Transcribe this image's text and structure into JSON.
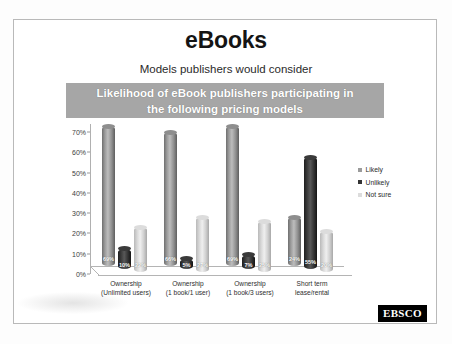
{
  "slide": {
    "title": "eBooks",
    "subtitle": "Models publishers would consider",
    "banner_line1": "Likelihood of eBook publishers participating in",
    "banner_line2": "the following pricing models",
    "banner_color": "#a6a6a6",
    "logo": "EBSCO"
  },
  "chart_data": {
    "type": "bar",
    "title": "Likelihood of eBook publishers participating in the following pricing models",
    "xlabel": "",
    "ylabel": "",
    "ylim": [
      0,
      70
    ],
    "grid": false,
    "legend_position": "right",
    "ytick_labels": [
      "0%",
      "10%",
      "20%",
      "30%",
      "40%",
      "50%",
      "60%",
      "70%"
    ],
    "ytick_values": [
      0,
      10,
      20,
      30,
      40,
      50,
      60,
      70
    ],
    "categories": [
      "Ownership (Unlimited users)",
      "Ownership (1 book/1 user)",
      "Ownership (1 book/3 users)",
      "Short term lease/rental"
    ],
    "category_lines": [
      [
        "Ownership",
        "(Unlimited users)"
      ],
      [
        "Ownership",
        "(1 book/1 user)"
      ],
      [
        "Ownership",
        "(1 book/3 users)"
      ],
      [
        "Short term",
        "lease/rental"
      ]
    ],
    "series": [
      {
        "name": "Likely",
        "color": "#9b9b9b",
        "values": [
          69,
          66,
          69,
          24
        ],
        "labels": [
          "69%",
          "66%",
          "69%",
          "24%"
        ]
      },
      {
        "name": "Unlikely",
        "color": "#333333",
        "values": [
          10,
          5,
          7,
          55
        ],
        "labels": [
          "10%",
          "5%",
          "7%",
          "55%"
        ]
      },
      {
        "name": "Not sure",
        "color": "#dcdcdc",
        "values": [
          22,
          27,
          25,
          20
        ],
        "labels": [
          "22%",
          "27%",
          "25%",
          "20%"
        ]
      }
    ]
  }
}
